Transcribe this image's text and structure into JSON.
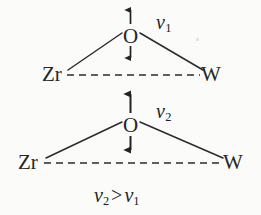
{
  "figure": {
    "background_color": "#fbfbfa",
    "ink_color": "#262626",
    "width": 261,
    "height": 215,
    "caption_relation": {
      "left_var": "ν",
      "left_sub": "2",
      "operator": ">",
      "right_var": "ν",
      "right_sub": "1"
    }
  },
  "diagrams": [
    {
      "id": "top",
      "bridge_atom": "O",
      "left_atom": "Zr",
      "right_atom": "W",
      "mode_label_var": "ν",
      "mode_label_sub": "1",
      "bond_style": "solid",
      "nonbond_style": "dashed",
      "arrow_style": "double-headed-vertical",
      "geometry": {
        "o_center_x": 130,
        "o_center_y": 36,
        "left_x": 52,
        "right_x": 210,
        "base_y": 75,
        "arrow_top_y": 8,
        "arrow_bottom_y": 64
      }
    },
    {
      "id": "bottom",
      "bridge_atom": "O",
      "left_atom": "Zr",
      "right_atom": "W",
      "mode_label_var": "ν",
      "mode_label_sub": "2",
      "bond_style": "solid",
      "nonbond_style": "dashed",
      "arrow_style": "double-headed-vertical",
      "geometry": {
        "o_center_x": 130,
        "o_center_y": 125,
        "left_x": 28,
        "right_x": 232,
        "base_y": 163,
        "arrow_top_y": 92,
        "arrow_bottom_y": 152
      }
    }
  ]
}
